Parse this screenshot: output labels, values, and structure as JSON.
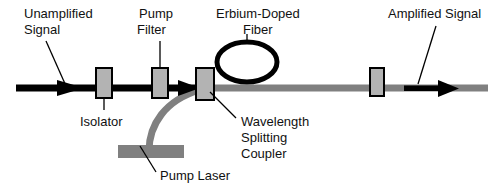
{
  "figure": {
    "type": "schematic-diagram",
    "background_color": "#ffffff",
    "colors": {
      "signal_line": "#000000",
      "pumped_line": "#808080",
      "component_fill": "#b3b3b3",
      "component_stroke": "#000000",
      "pump_laser_fill": "#808080",
      "text": "#111111",
      "leader_line": "#000000"
    }
  },
  "labels": {
    "unamplified_signal": {
      "line1": "Unamplified",
      "line2": "Signal"
    },
    "pump_filter": {
      "line1": "Pump",
      "line2": "Filter"
    },
    "erbium_doped_fiber": {
      "line1": "Erbium-Doped",
      "line2": "Fiber"
    },
    "amplified_signal": {
      "line1": "Amplified Signal"
    },
    "isolator": {
      "line1": "Isolator"
    },
    "wavelength_splitting_coupler": {
      "line1": "Wavelength",
      "line2": "Splitting",
      "line3": "Coupler"
    },
    "pump_laser": {
      "line1": "Pump Laser"
    }
  },
  "components": [
    {
      "name": "isolator-left",
      "kind": "box",
      "x": 96,
      "y": 68,
      "width": 16,
      "height": 30
    },
    {
      "name": "pump-filter",
      "kind": "box",
      "x": 152,
      "y": 68,
      "width": 16,
      "height": 30
    },
    {
      "name": "wavelength-splitting-coupler",
      "kind": "box",
      "x": 196,
      "y": 68,
      "width": 18,
      "height": 32
    },
    {
      "name": "isolator-right",
      "kind": "box",
      "x": 370,
      "y": 68,
      "width": 14,
      "height": 28
    },
    {
      "name": "erbium-doped-fiber-loop",
      "kind": "ellipse",
      "cx": 247,
      "cy": 62,
      "rx": 30,
      "ry": 20
    },
    {
      "name": "pump-laser",
      "kind": "bar",
      "x": 118,
      "y": 145,
      "width": 66,
      "height": 13
    }
  ]
}
